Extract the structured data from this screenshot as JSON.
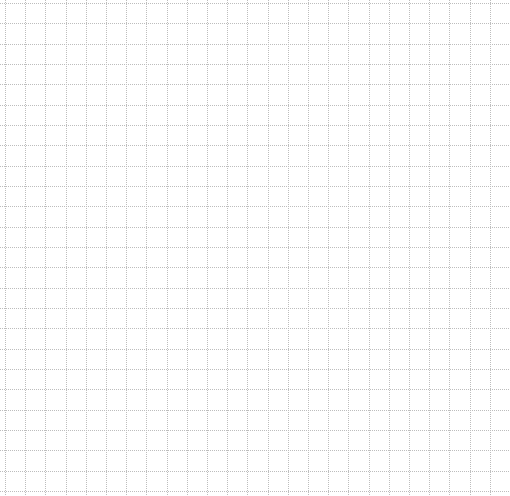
{
  "canvas": {
    "type": "grid-paper",
    "background_color": "#ffffff",
    "line_color": "#bdbdbd",
    "line_style": "dotted",
    "vertical_line_count": 25,
    "horizontal_line_count": 25
  }
}
